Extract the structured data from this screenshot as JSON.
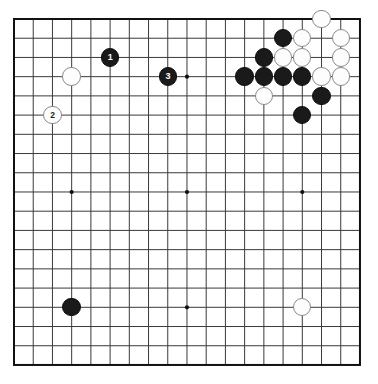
{
  "board": {
    "title": "Go board diagram",
    "size": 19,
    "origin_x": 14,
    "origin_y": 19,
    "spacing": 19.22,
    "stone_radius": 9.2,
    "colors": {
      "background": "#ffffff",
      "grid_line": "#3a3a3a",
      "border_line": "#111111",
      "black_stone": "#1a1a1a",
      "white_stone": "#fdfdfd",
      "white_stone_edge": "#8a8a8a",
      "move_label_on_black": "#ffffff",
      "move_label_on_white": "#222222"
    },
    "star_points": [
      {
        "col": 3,
        "row": 3
      },
      {
        "col": 9,
        "row": 3
      },
      {
        "col": 15,
        "row": 3
      },
      {
        "col": 3,
        "row": 9
      },
      {
        "col": 9,
        "row": 9
      },
      {
        "col": 15,
        "row": 9
      },
      {
        "col": 3,
        "row": 15
      },
      {
        "col": 9,
        "row": 15
      },
      {
        "col": 15,
        "row": 15
      }
    ],
    "stones": [
      {
        "col": 16,
        "row": 0,
        "color": "white",
        "label": ""
      },
      {
        "col": 14,
        "row": 1,
        "color": "black",
        "label": ""
      },
      {
        "col": 15,
        "row": 1,
        "color": "white",
        "label": ""
      },
      {
        "col": 17,
        "row": 1,
        "color": "white",
        "label": ""
      },
      {
        "col": 5,
        "row": 2,
        "color": "black",
        "label": "1"
      },
      {
        "col": 13,
        "row": 2,
        "color": "black",
        "label": ""
      },
      {
        "col": 14,
        "row": 2,
        "color": "white",
        "label": ""
      },
      {
        "col": 15,
        "row": 2,
        "color": "white",
        "label": ""
      },
      {
        "col": 17,
        "row": 2,
        "color": "white",
        "label": ""
      },
      {
        "col": 3,
        "row": 3,
        "color": "white",
        "label": ""
      },
      {
        "col": 8,
        "row": 3,
        "color": "black",
        "label": "3"
      },
      {
        "col": 12,
        "row": 3,
        "color": "black",
        "label": ""
      },
      {
        "col": 13,
        "row": 3,
        "color": "black",
        "label": ""
      },
      {
        "col": 14,
        "row": 3,
        "color": "black",
        "label": ""
      },
      {
        "col": 15,
        "row": 3,
        "color": "black",
        "label": ""
      },
      {
        "col": 16,
        "row": 3,
        "color": "white",
        "label": ""
      },
      {
        "col": 17,
        "row": 3,
        "color": "white",
        "label": ""
      },
      {
        "col": 13,
        "row": 4,
        "color": "white",
        "label": ""
      },
      {
        "col": 16,
        "row": 4,
        "color": "black",
        "label": ""
      },
      {
        "col": 2,
        "row": 5,
        "color": "white",
        "label": "2"
      },
      {
        "col": 15,
        "row": 5,
        "color": "black",
        "label": ""
      },
      {
        "col": 3,
        "row": 15,
        "color": "black",
        "label": ""
      },
      {
        "col": 15,
        "row": 15,
        "color": "white",
        "label": ""
      }
    ]
  }
}
